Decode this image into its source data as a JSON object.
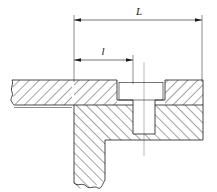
{
  "drawing": {
    "type": "engineering-cross-section",
    "title": "",
    "description": "Sectional view of a bolted joint: an upper plate with a counterbored through hole seated on a lower block with a tapped hole; overall length L and partial length l are dimensioned above the section.",
    "canvas": {
      "width": 217,
      "height": 192,
      "background": "#ffffff"
    },
    "line_color": "#1a1a1a",
    "hatch_color": "#1a1a1a",
    "centerline_color": "#7a7a7a",
    "dimensions": [
      {
        "id": "dim-L",
        "label": "L",
        "style": "italic",
        "arrow_ends": "both",
        "y": 20,
        "x_start": 74,
        "x_end": 202,
        "label_x": 139,
        "label_y": 13
      },
      {
        "id": "dim-l",
        "label": "l",
        "style": "italic",
        "arrow_ends": "both",
        "y": 60,
        "x_start": 74,
        "x_end": 133,
        "label_x": 103,
        "label_y": 53
      }
    ],
    "features": [
      {
        "id": "upper-plate",
        "name": "upper plate",
        "hatch_direction": "right",
        "top": 80,
        "bottom": 105
      },
      {
        "id": "lower-block",
        "name": "lower block",
        "hatch_direction": "left",
        "top": 105,
        "bottom": 190
      },
      {
        "id": "counterbore",
        "name": "counterbore recess",
        "left": 117,
        "right": 165,
        "top": 82,
        "bottom": 100
      },
      {
        "id": "bolt-shank-hole",
        "name": "tapped hole",
        "left": 133,
        "right": 155,
        "top": 100,
        "bottom": 134
      },
      {
        "id": "centerline",
        "name": "hole axis centerline",
        "x": 144,
        "top": 62,
        "bottom": 156
      },
      {
        "id": "break-left",
        "name": "left break line",
        "x": 10,
        "type": "wavy-break"
      },
      {
        "id": "break-bottom",
        "name": "bottom break line",
        "y": 180,
        "type": "wavy-break"
      }
    ]
  }
}
